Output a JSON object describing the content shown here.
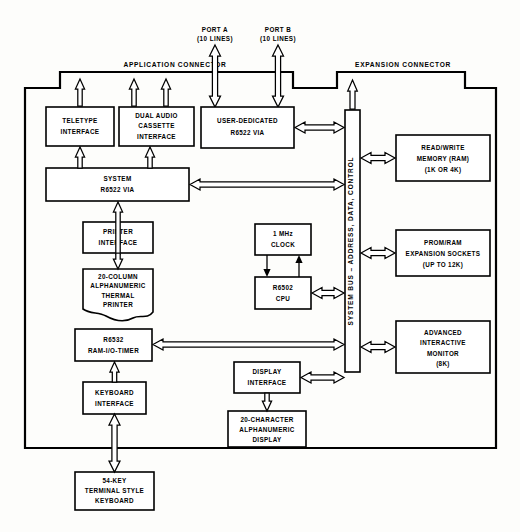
{
  "diagram": {
    "type": "block-diagram",
    "connectors": {
      "application": "APPLICATION CONNECTOR",
      "expansion": "EXPANSION CONNECTOR"
    },
    "ports": [
      {
        "name": "PORT A",
        "lines": "(10 LINES)"
      },
      {
        "name": "PORT B",
        "lines": "(10 LINES)"
      }
    ],
    "bus": {
      "label": "SYSTEM BUS – ADDRESS, DATA, CONTROL"
    },
    "blocks": {
      "teletype": [
        "TELETYPE",
        "INTERFACE"
      ],
      "cassette": [
        "DUAL AUDIO",
        "CASSETTE",
        "INTERFACE"
      ],
      "user_via": [
        "USER-DEDICATED",
        "R6522 VIA"
      ],
      "system_via": [
        "SYSTEM",
        "R6522 VIA"
      ],
      "printer_interface": [
        "PRINTER",
        "INTERFACE"
      ],
      "thermal_printer": [
        "20-COLUMN",
        "ALPHANUMERIC",
        "THERMAL",
        "PRINTER"
      ],
      "r6532": [
        "R6532",
        "RAM-I/O-TIMER"
      ],
      "keyboard_interface": [
        "KEYBOARD",
        "INTERFACE"
      ],
      "keyboard": [
        "54-KEY",
        "TERMINAL STYLE",
        "KEYBOARD"
      ],
      "clock": [
        "1 MHz",
        "CLOCK"
      ],
      "cpu": [
        "R6502",
        "CPU"
      ],
      "display_interface": [
        "DISPLAY",
        "INTERFACE"
      ],
      "display": [
        "20-CHARACTER",
        "ALPHANUMERIC",
        "DISPLAY"
      ],
      "ram": [
        "READ/WRITE",
        "MEMORY (RAM)",
        "(1K OR 4K)"
      ],
      "prom_ram": [
        "PROM/RAM",
        "EXPANSION SOCKETS",
        "(UP TO 12K)"
      ],
      "monitor": [
        "ADVANCED",
        "INTERACTIVE",
        "MONITOR",
        "(8K)"
      ]
    },
    "colors": {
      "ink": "#000000",
      "paper": "#fdfdfb",
      "fill": "#ffffff"
    }
  }
}
